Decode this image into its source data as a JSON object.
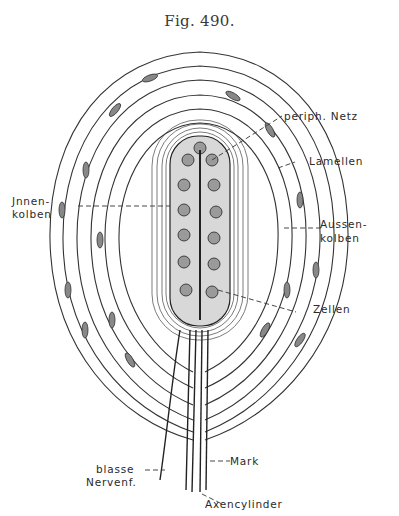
{
  "figure": {
    "title": "Fig. 490.",
    "colors": {
      "ink": "#2a2a2a",
      "paper": "#ffffff"
    }
  },
  "labels": {
    "periph_netz": "periph. Netz",
    "lamellen": "Lamellen",
    "innenkolben_1": "Jnnen-",
    "innenkolben_2": "kolben",
    "aussenkolben_1": "Aussen-",
    "aussenkolben_2": "kolben",
    "zellen": "Zellen",
    "blasse_1": "blasse",
    "blasse_2": "Nervenf.",
    "mark": "Mark",
    "axencylinder": "Axencylinder"
  }
}
